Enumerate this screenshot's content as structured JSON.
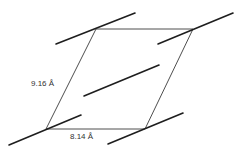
{
  "diagram": {
    "type": "unit-cell-projection",
    "cell": {
      "vertices": [
        {
          "name": "top-left",
          "x": 96,
          "y": 29
        },
        {
          "name": "top-right",
          "x": 193,
          "y": 29
        },
        {
          "name": "bottom-right",
          "x": 145,
          "y": 129
        },
        {
          "name": "bottom-left",
          "x": 46,
          "y": 129
        }
      ]
    },
    "molecules": [
      {
        "name": "molecule-top-left",
        "x1": 56,
        "y1": 44,
        "x2": 135,
        "y2": 13
      },
      {
        "name": "molecule-top-right",
        "x1": 158,
        "y1": 44,
        "x2": 233,
        "y2": 13
      },
      {
        "name": "molecule-center",
        "x1": 84,
        "y1": 96,
        "x2": 159,
        "y2": 65
      },
      {
        "name": "molecule-bottom-left",
        "x1": 9,
        "y1": 145,
        "x2": 81,
        "y2": 115
      },
      {
        "name": "molecule-bottom-right",
        "x1": 108,
        "y1": 144,
        "x2": 183,
        "y2": 113
      }
    ],
    "labels": {
      "side_a": "9.16  Å",
      "side_b": "8.14  Å"
    },
    "colors": {
      "line": "#1e1e1e",
      "cell_edge": "#3a3a3a",
      "text": "#333333",
      "background": "#ffffff"
    }
  }
}
